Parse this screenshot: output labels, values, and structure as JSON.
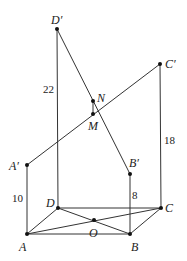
{
  "diagram": {
    "type": "3d-geometry",
    "points": {
      "A": {
        "label": "A",
        "x": 27,
        "y": 234
      },
      "B": {
        "label": "B",
        "x": 130,
        "y": 234
      },
      "C": {
        "label": "C",
        "x": 161,
        "y": 208
      },
      "D": {
        "label": "D",
        "x": 58,
        "y": 208
      },
      "O": {
        "label": "O",
        "x": 94,
        "y": 220
      },
      "A1": {
        "label": "A′",
        "x": 27,
        "y": 165
      },
      "B1": {
        "label": "B′",
        "x": 130,
        "y": 174
      },
      "C1": {
        "label": "C′",
        "x": 160,
        "y": 64
      },
      "D1": {
        "label": "D′",
        "x": 57,
        "y": 29
      },
      "M": {
        "label": "M",
        "x": 93,
        "y": 114
      },
      "N": {
        "label": "N",
        "x": 93,
        "y": 101
      }
    },
    "lengths": {
      "AA1": "10",
      "BB1": "8",
      "CC1": "18",
      "DD1": "22"
    }
  }
}
